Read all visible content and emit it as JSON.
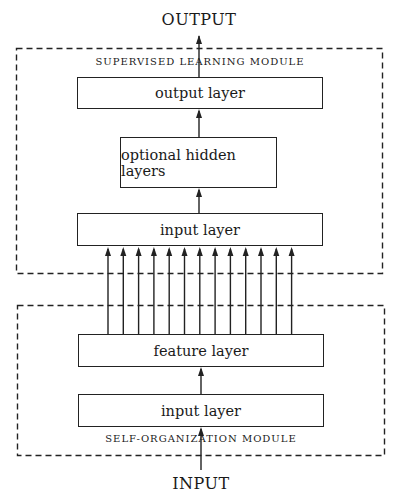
{
  "diagram": {
    "output_label": "OUTPUT",
    "input_label": "INPUT",
    "supervised_module": {
      "title": "SUPERVISED LEARNING MODULE",
      "layers": [
        {
          "label": "output layer"
        },
        {
          "label": "optional hidden layers"
        },
        {
          "label": "input layer"
        }
      ]
    },
    "self_organization_module": {
      "title": "SELF-ORGANIZATION MODULE",
      "layers": [
        {
          "label": "feature layer"
        },
        {
          "label": "input layer"
        }
      ]
    },
    "connection_count": 13,
    "colors": {
      "line": "#222222",
      "background": "#ffffff"
    }
  }
}
